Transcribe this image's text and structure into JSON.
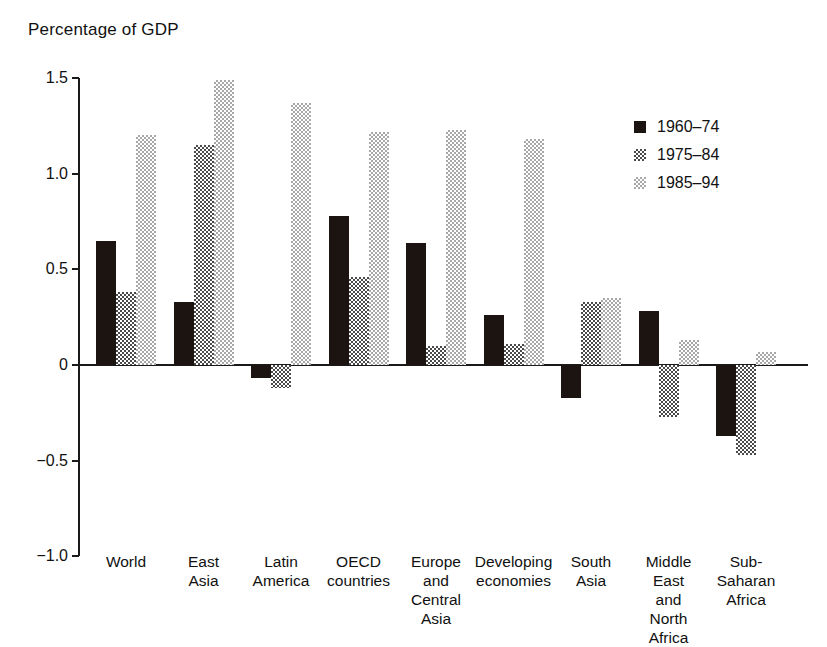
{
  "chart_data": {
    "type": "bar",
    "title": "Percentage of GDP",
    "xlabel": "",
    "ylabel": "",
    "ylim": [
      -1.0,
      1.5
    ],
    "yticks": [
      "1.5",
      "1.0",
      "0.5",
      "0",
      "-0.5",
      "-1.0"
    ],
    "ytick_values": [
      1.5,
      1.0,
      0.5,
      0,
      -0.5,
      -1.0
    ],
    "grid": false,
    "legend_position": "top-right",
    "categories": [
      "World",
      "East\nAsia",
      "Latin\nAmerica",
      "OECD\ncountries",
      "Europe\nand\nCentral\nAsia",
      "Developing\neconomies",
      "South\nAsia",
      "Middle\nEast\nand\nNorth\nAfrica",
      "Sub-\nSaharan\nAfrica"
    ],
    "series": [
      {
        "name": "1960–74",
        "color": "#1c1410",
        "values": [
          0.65,
          0.33,
          -0.07,
          0.78,
          0.64,
          0.26,
          -0.17,
          0.28,
          -0.37
        ]
      },
      {
        "name": "1975–84",
        "color": "#4a4a4a",
        "values": [
          0.38,
          1.15,
          -0.12,
          0.46,
          0.1,
          0.11,
          0.33,
          -0.27,
          -0.47
        ]
      },
      {
        "name": "1985–94",
        "color": "#a8a8a8",
        "values": [
          1.2,
          1.49,
          1.37,
          1.22,
          1.23,
          1.18,
          0.35,
          0.13,
          0.07
        ]
      }
    ]
  },
  "legend": {
    "items": [
      {
        "label": "1960–74"
      },
      {
        "label": "1975–84"
      },
      {
        "label": "1985–94"
      }
    ]
  }
}
